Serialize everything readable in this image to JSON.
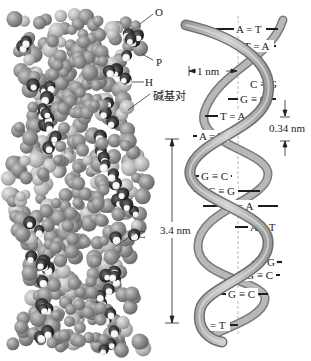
{
  "space_filling_model": {
    "labels": [
      {
        "id": "O",
        "text": "O"
      },
      {
        "id": "P",
        "text": "P"
      },
      {
        "id": "H",
        "text": "H"
      },
      {
        "id": "base_pair",
        "text": "碱基对"
      },
      {
        "id": "C",
        "text": "C"
      }
    ]
  },
  "ribbon_model": {
    "base_pairs": [
      {
        "text": "A = T"
      },
      {
        "text": "T = A"
      },
      {
        "text": "C ≡ G"
      },
      {
        "text": "G ≡ C"
      },
      {
        "text": "T = A"
      },
      {
        "text": "A = T"
      },
      {
        "text": "G ≡ C"
      },
      {
        "text": "C ≡ G"
      },
      {
        "text": "T = A"
      },
      {
        "text": "A = T"
      },
      {
        "text": "≡ G"
      },
      {
        "text": "G ≡ C"
      },
      {
        "text": "G ≡ C"
      },
      {
        "text": "A = T"
      }
    ],
    "dimensions": {
      "diameter": "1 nm",
      "rise_per_base": "0.34 nm",
      "pitch": "3.4 nm"
    }
  },
  "colors": {
    "ribbon": "#a8a8a8",
    "ribbon_dark": "#7a7a7a",
    "atom_gray": "#8c8c8c",
    "atom_dark": "#2b2b2b",
    "atom_light": "#f4f4f4",
    "text": "#222222"
  }
}
